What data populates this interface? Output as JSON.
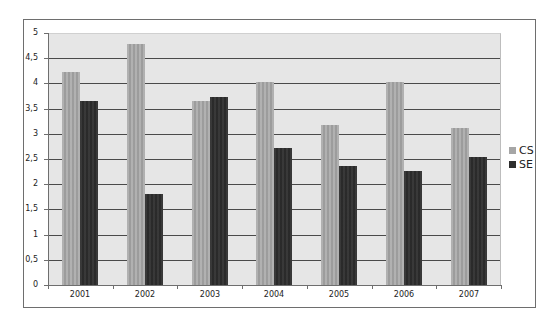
{
  "chart_data": {
    "type": "bar",
    "title": "",
    "xlabel": "",
    "ylabel": "",
    "categories": [
      "2001",
      "2002",
      "2003",
      "2004",
      "2005",
      "2006",
      "2007"
    ],
    "series": [
      {
        "name": "CS",
        "color": "#a6a6a6",
        "values": [
          4.22,
          4.78,
          3.66,
          4.02,
          3.18,
          4.02,
          3.12
        ]
      },
      {
        "name": "SE",
        "color": "#2e2e2e",
        "values": [
          3.66,
          1.8,
          3.74,
          2.72,
          2.36,
          2.26,
          2.54
        ]
      }
    ],
    "ylim": [
      0,
      5
    ],
    "yticks": [
      "0",
      "0,5",
      "1",
      "1,5",
      "2",
      "2,5",
      "3",
      "3,5",
      "4",
      "4,5",
      "5"
    ],
    "grid": true,
    "legend_position": "right"
  }
}
